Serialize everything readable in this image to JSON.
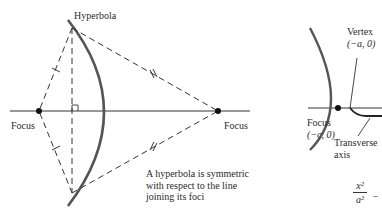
{
  "left_figure": {
    "title": "Hyperbola",
    "left_focus_label": "Focus",
    "right_focus_label": "Focus",
    "caption_lines": [
      "A hyperbola is symmetric",
      "with respect to the line",
      "joining its foci"
    ]
  },
  "right_figure": {
    "vertex_label": "Vertex",
    "vertex_coords": "(−a, 0)",
    "focus_label": "Focus",
    "focus_coords": "(−c, 0)",
    "axis_label_line1": "Transverse",
    "axis_label_line2": "axis",
    "equation": {
      "numerator": "x²",
      "denominator": "a²",
      "trailing": "−"
    }
  },
  "colors": {
    "ink": "#2a2a2a",
    "curve": "#555555",
    "background": "#ffffff"
  }
}
